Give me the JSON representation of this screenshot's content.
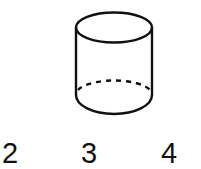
{
  "figure": {
    "shape": "cylinder",
    "stroke_color": "#111111",
    "hidden_edge_style": "dashed"
  },
  "options": [
    {
      "label": "2"
    },
    {
      "label": "3"
    },
    {
      "label": "4"
    }
  ]
}
